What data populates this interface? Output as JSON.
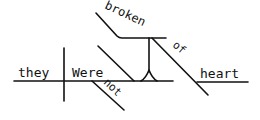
{
  "diagram": {
    "type": "sentence-diagram",
    "words": {
      "subject": "they",
      "verb": "Were",
      "adverb": "not",
      "complement": "broken",
      "preposition": "of",
      "object": "heart"
    },
    "colors": {
      "line": "#111111",
      "background": "#ffffff"
    }
  }
}
